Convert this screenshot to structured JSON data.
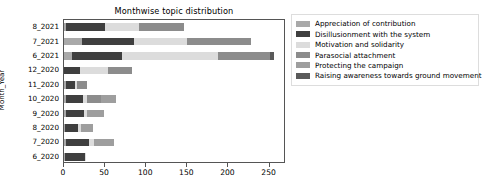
{
  "chart_data": {
    "type": "bar",
    "orientation": "horizontal",
    "stacked": true,
    "title": "Monthwise topic distribution",
    "xlabel": "",
    "ylabel": "Month_Year",
    "xlim": [
      0,
      270
    ],
    "ylim": [
      0,
      10
    ],
    "grid": false,
    "legend_position": "right",
    "xticks": [
      0,
      50,
      100,
      150,
      200,
      250
    ],
    "xtick_labels": [
      "0",
      "50",
      "100",
      "150",
      "200",
      "250"
    ],
    "categories": [
      "8_2021",
      "7_2021",
      "6_2021",
      "12_2020",
      "11_2020",
      "10_2020",
      "9_2020",
      "8_2020",
      "7_2020",
      "6_2020"
    ],
    "series": [
      {
        "name": "Appreciation of contribution",
        "color": "#a9a9a9",
        "values": [
          3,
          22,
          10,
          0,
          2,
          2,
          2,
          1,
          3,
          1
        ]
      },
      {
        "name": "Disillusionment with the system",
        "color": "#3f3f3f",
        "values": [
          47,
          63,
          60,
          20,
          11,
          21,
          22,
          16,
          27,
          25
        ]
      },
      {
        "name": "Motivation and solidarity",
        "color": "#dcdcdc",
        "values": [
          41,
          65,
          117,
          33,
          3,
          5,
          4,
          4,
          6,
          1
        ]
      },
      {
        "name": "Parasocial attachment",
        "color": "#8c8c8c",
        "values": [
          55,
          78,
          63,
          30,
          12,
          17,
          0,
          0,
          0,
          0
        ]
      },
      {
        "name": "Protecting the campaign",
        "color": "#9e9e9e",
        "values": [
          0,
          0,
          0,
          0,
          0,
          18,
          21,
          14,
          25,
          0
        ]
      },
      {
        "name": "Raising awareness towards ground movement",
        "color": "#5a5a5a",
        "values": [
          0,
          0,
          6,
          0,
          0,
          0,
          0,
          0,
          0,
          0
        ]
      }
    ],
    "totals": [
      146,
      228,
      256,
      83,
      28,
      63,
      49,
      35,
      61,
      27
    ]
  }
}
